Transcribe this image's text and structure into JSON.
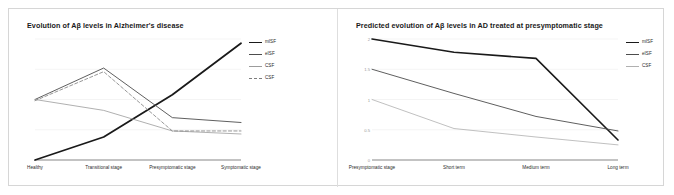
{
  "figure": {
    "background": "#ffffff",
    "border_color": "#d6d6d6"
  },
  "panels": [
    {
      "id": "left",
      "title": "Evolution of Aβ levels in Alzheimer's disease"
    },
    {
      "id": "right",
      "title": "Predicted evolution of Aβ levels in AD treated at presymptomatic stage"
    }
  ],
  "chart_data": [
    {
      "type": "line",
      "title": "Evolution of Aβ levels in Alzheimer's disease",
      "xlabel": "",
      "ylabel": "",
      "grid": true,
      "legend_position": "right",
      "categories": [
        "Healthy",
        "Transitional stage",
        "Presymptomatic stage",
        "Symptomatic stage"
      ],
      "yticks": [
        "",
        "",
        "",
        "",
        ""
      ],
      "ylim": [
        0,
        2
      ],
      "series": [
        {
          "name": "Plaques",
          "color": "#1a1a1a",
          "width": 1.8,
          "dash": "none",
          "values": [
            0.0,
            0.38,
            1.08,
            1.93
          ]
        },
        {
          "name": "mISF",
          "color": "#4d4d4d",
          "width": 0.9,
          "dash": "none",
          "values": [
            1.0,
            1.52,
            0.7,
            0.62
          ]
        },
        {
          "name": "CSF",
          "color": "#9c9c9c",
          "width": 0.8,
          "dash": "none",
          "values": [
            1.0,
            0.82,
            0.48,
            0.43
          ]
        },
        {
          "name": "eISF",
          "color": "#7d7d7d",
          "width": 0.8,
          "dash": "dashed",
          "values": [
            0.98,
            1.46,
            0.48,
            0.48
          ]
        }
      ]
    },
    {
      "type": "line",
      "title": "Predicted evolution of Aβ levels in AD treated at presymptomatic stage",
      "xlabel": "",
      "ylabel": "",
      "grid": true,
      "legend_position": "right",
      "categories": [
        "Presymptomatic stage",
        "Short term",
        "Medium term",
        "Long term"
      ],
      "yticks": [
        "2",
        "1.5",
        "1",
        "0.5",
        "0"
      ],
      "ylim": [
        0,
        2
      ],
      "series": [
        {
          "name": "mISF",
          "color": "#1a1a1a",
          "width": 1.6,
          "dash": "none",
          "values": [
            2.0,
            1.78,
            1.68,
            0.33
          ]
        },
        {
          "name": "eISF",
          "color": "#4d4d4d",
          "width": 0.9,
          "dash": "none",
          "values": [
            1.5,
            1.1,
            0.72,
            0.48
          ]
        },
        {
          "name": "CSF",
          "color": "#b0b0b0",
          "width": 0.8,
          "dash": "none",
          "values": [
            1.0,
            0.52,
            0.38,
            0.25
          ]
        }
      ]
    }
  ],
  "legends": [
    {
      "panel": "left",
      "items": [
        {
          "label": "mISF",
          "color": "#1a1a1a",
          "width": 1.8,
          "dash": "none"
        },
        {
          "label": "eISF",
          "color": "#4d4d4d",
          "width": 1.1,
          "dash": "none"
        },
        {
          "label": "CSF",
          "color": "#9c9c9c",
          "width": 0.9,
          "dash": "none"
        },
        {
          "label": "CSF",
          "color": "#7d7d7d",
          "width": 0.9,
          "dash": "dashed"
        }
      ]
    },
    {
      "panel": "right",
      "items": [
        {
          "label": "mISF",
          "color": "#1a1a1a",
          "width": 1.8,
          "dash": "none"
        },
        {
          "label": "eISF",
          "color": "#4d4d4d",
          "width": 1.0,
          "dash": "none"
        },
        {
          "label": "CSF",
          "color": "#b0b0b0",
          "width": 0.9,
          "dash": "none"
        }
      ]
    }
  ]
}
